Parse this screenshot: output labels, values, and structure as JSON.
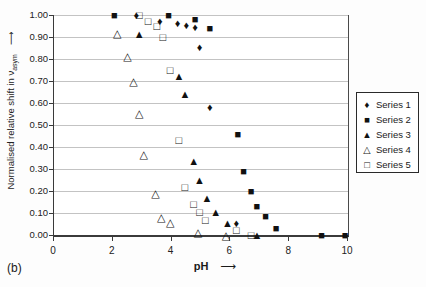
{
  "figure_label": "(b)",
  "colors": {
    "foreground": "#1a1a1a",
    "grid": "#c3c3c3",
    "background": "#ffffff",
    "marker": "#111111"
  },
  "axes": {
    "y_title": {
      "text": "Normalised relative shift in ν",
      "subscript": "asym",
      "arrow": "⟶"
    },
    "x_title": {
      "text": "pH",
      "arrow": "⟶"
    },
    "y_ticks": [
      "1.00",
      "0.90",
      "0.80",
      "0.70",
      "0.60",
      "0.50",
      "0.40",
      "0.30",
      "0.20",
      "0.10",
      "0.00"
    ],
    "x_ticks": [
      "0",
      "2",
      "4",
      "6",
      "8",
      "10"
    ]
  },
  "legend": {
    "position": "right-outside",
    "items": [
      {
        "label": "Series 1",
        "marker": "filled-diamond",
        "glyph": "♦"
      },
      {
        "label": "Series 2",
        "marker": "filled-square",
        "glyph": "■"
      },
      {
        "label": "Series 3",
        "marker": "filled-triangle",
        "glyph": "▲"
      },
      {
        "label": "Series 4",
        "marker": "open-triangle",
        "glyph": "△"
      },
      {
        "label": "Series 5",
        "marker": "open-square",
        "glyph": "□"
      }
    ]
  },
  "chart_data": {
    "type": "scatter",
    "title": "",
    "xlabel": "pH",
    "ylabel": "Normalised relative shift in v_asym",
    "xlim": [
      0,
      10
    ],
    "ylim": [
      0.0,
      1.0
    ],
    "x_tick_step": 2,
    "y_tick_step": 0.1,
    "grid": "horizontal",
    "legend_position": "right-outside",
    "series": [
      {
        "name": "Series 1",
        "marker": "filled-diamond",
        "glyph": "♦",
        "points": [
          [
            2.8,
            1.0
          ],
          [
            3.6,
            0.975
          ],
          [
            4.2,
            0.965
          ],
          [
            4.5,
            0.955
          ],
          [
            4.8,
            0.945
          ],
          [
            4.95,
            0.855
          ],
          [
            5.3,
            0.58
          ],
          [
            6.2,
            0.055
          ]
        ]
      },
      {
        "name": "Series 2",
        "marker": "filled-square",
        "glyph": "■",
        "points": [
          [
            2.05,
            1.0
          ],
          [
            3.9,
            1.0
          ],
          [
            4.8,
            0.98
          ],
          [
            5.3,
            0.94
          ],
          [
            6.25,
            0.46
          ],
          [
            6.45,
            0.29
          ],
          [
            6.7,
            0.2
          ],
          [
            6.9,
            0.13
          ],
          [
            7.2,
            0.085
          ],
          [
            7.55,
            0.03
          ],
          [
            9.1,
            0.0
          ],
          [
            9.9,
            0.0
          ]
        ]
      },
      {
        "name": "Series 3",
        "marker": "filled-triangle",
        "glyph": "▲",
        "points": [
          [
            2.9,
            0.915
          ],
          [
            4.25,
            0.725
          ],
          [
            4.45,
            0.64
          ],
          [
            4.75,
            0.335
          ],
          [
            4.95,
            0.25
          ],
          [
            5.2,
            0.17
          ],
          [
            5.5,
            0.105
          ],
          [
            5.9,
            0.055
          ],
          [
            6.9,
            0.0
          ]
        ]
      },
      {
        "name": "Series 4",
        "marker": "open-triangle",
        "glyph": "△",
        "points": [
          [
            2.15,
            0.92
          ],
          [
            2.5,
            0.815
          ],
          [
            2.7,
            0.7
          ],
          [
            2.9,
            0.555
          ],
          [
            3.05,
            0.37
          ],
          [
            3.45,
            0.19
          ],
          [
            3.65,
            0.08
          ],
          [
            3.95,
            0.06
          ],
          [
            4.9,
            0.015
          ],
          [
            5.85,
            0.0
          ]
        ]
      },
      {
        "name": "Series 5",
        "marker": "open-square",
        "glyph": "□",
        "points": [
          [
            2.9,
            1.0
          ],
          [
            3.2,
            0.975
          ],
          [
            3.5,
            0.95
          ],
          [
            3.7,
            0.9
          ],
          [
            3.95,
            0.75
          ],
          [
            4.25,
            0.43
          ],
          [
            4.45,
            0.22
          ],
          [
            4.75,
            0.14
          ],
          [
            4.95,
            0.105
          ],
          [
            5.15,
            0.07
          ],
          [
            6.2,
            0.025
          ],
          [
            6.7,
            0.0
          ]
        ]
      }
    ]
  }
}
